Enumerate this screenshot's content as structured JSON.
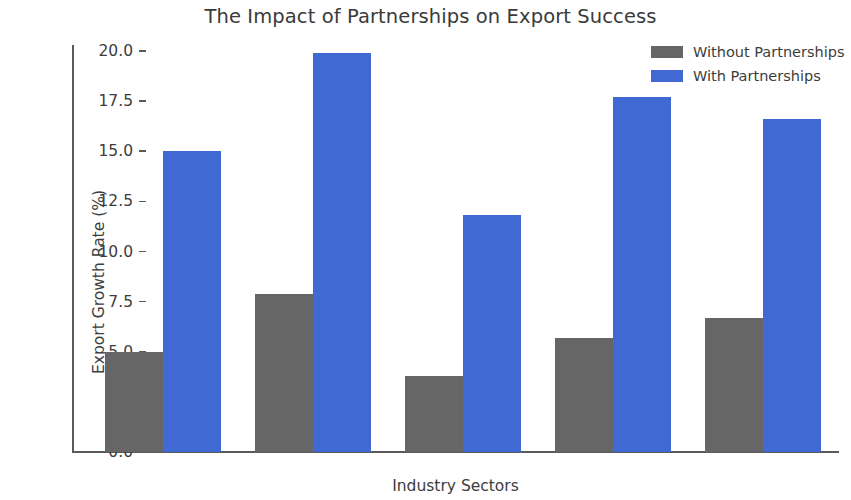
{
  "chart_data": {
    "type": "bar",
    "title": "The Impact of Partnerships on Export Success",
    "xlabel": "Industry Sectors",
    "ylabel": "Export Growth Rate (%)",
    "categories": [
      "Automotive",
      "Technology",
      "Agriculture",
      "Pharmaceuticals",
      "Machinery"
    ],
    "series": [
      {
        "name": "Without Partnerships",
        "color": "#666666",
        "values": [
          5.0,
          7.9,
          3.8,
          5.7,
          6.7
        ]
      },
      {
        "name": "With Partnerships",
        "color": "#4169d4",
        "values": [
          15.0,
          19.9,
          11.8,
          17.7,
          16.6
        ]
      }
    ],
    "ylim": [
      0.0,
      20.0
    ],
    "yticks": [
      "0.0",
      "2.5",
      "5.0",
      "7.5",
      "10.0",
      "12.5",
      "15.0",
      "17.5",
      "20.0"
    ],
    "ytick_values": [
      0.0,
      2.5,
      5.0,
      7.5,
      10.0,
      12.5,
      15.0,
      17.5,
      20.0
    ],
    "grid": false,
    "legend_position": "upper right",
    "background_color": "#ffffff"
  }
}
